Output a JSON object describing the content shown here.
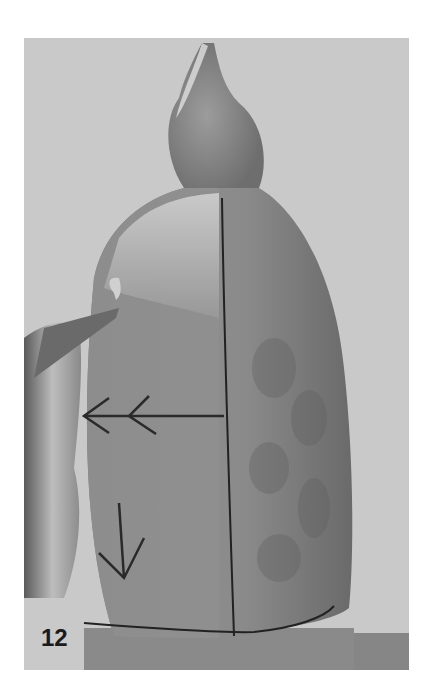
{
  "figure": {
    "step_number": "12",
    "colors": {
      "background": "#c9c9c9",
      "wood_light": "#b8b8b8",
      "wood_dark": "#6e6e6e",
      "page": "#ffffff"
    }
  }
}
